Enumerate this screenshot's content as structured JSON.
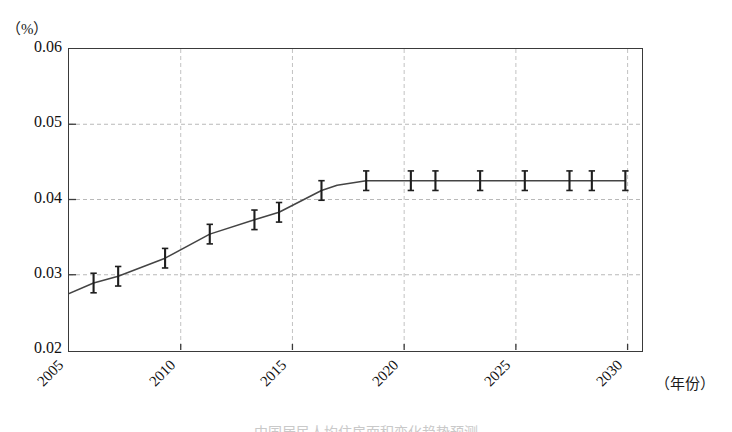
{
  "figure": {
    "unit_label": "（%）",
    "xaxis_name": "（年份）",
    "caption": "中国居民人均住房面积变化趋势预测"
  },
  "chart_data": {
    "type": "line",
    "title": "",
    "xlabel": "（年份）",
    "ylabel": "（%）",
    "xlim": [
      2005,
      2030.6
    ],
    "ylim": [
      0.02,
      0.06
    ],
    "ytick_labels": [
      "0.06",
      "0.05",
      "0.04",
      "0.03",
      "0.02"
    ],
    "yticks": [
      0.06,
      0.05,
      0.04,
      0.03,
      0.02
    ],
    "xtick_labels": [
      "2005",
      "2010",
      "2015",
      "2020",
      "2025",
      "2030"
    ],
    "xticks": [
      2005,
      2010,
      2015,
      2020,
      2025,
      2030
    ],
    "grid": "dashed-light",
    "legend": "none",
    "series": [
      {
        "name": "预测值",
        "line_color": "#444444",
        "marker": "errorbar-ibeam",
        "x": [
          2005.0,
          2006.1,
          2007.2,
          2009.3,
          2011.3,
          2013.3,
          2014.4,
          2016.3,
          2017.0,
          2018.3,
          2020.3,
          2021.4,
          2023.4,
          2025.4,
          2027.4,
          2028.4,
          2029.9
        ],
        "y": [
          0.0275,
          0.0289,
          0.0298,
          0.0322,
          0.0354,
          0.0373,
          0.0383,
          0.0412,
          0.0419,
          0.0425,
          0.0425,
          0.0425,
          0.0425,
          0.0425,
          0.0425,
          0.0425,
          0.0425
        ],
        "errorbar_x": [
          2006.1,
          2007.2,
          2009.3,
          2011.3,
          2013.3,
          2014.4,
          2016.3,
          2018.3,
          2020.3,
          2021.4,
          2023.4,
          2025.4,
          2027.4,
          2028.4,
          2029.9
        ],
        "errorbar_y": [
          0.0289,
          0.0298,
          0.0322,
          0.0354,
          0.0373,
          0.0383,
          0.0412,
          0.0425,
          0.0425,
          0.0425,
          0.0425,
          0.0425,
          0.0425,
          0.0425,
          0.0425
        ],
        "errorbar_halfwidth": 0.0013
      }
    ]
  }
}
